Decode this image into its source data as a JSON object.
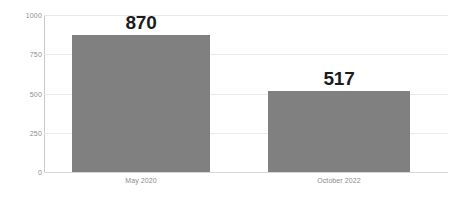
{
  "chart_data": {
    "type": "bar",
    "title": "",
    "subtitle": "",
    "xlabel": "",
    "ylabel": "",
    "categories": [
      "May 2020",
      "October 2022"
    ],
    "values": [
      870,
      517
    ],
    "data_labels": [
      "870",
      "517"
    ],
    "ylim": [
      0,
      1000
    ],
    "yticks": [
      1000,
      750,
      500,
      250,
      0
    ],
    "ytick_labels": [
      "1000",
      "750",
      "500",
      "250",
      "0"
    ],
    "grid": true,
    "legend": false,
    "legend_position": "none",
    "series": [
      {
        "name": "",
        "values": [
          870,
          517
        ]
      }
    ],
    "colors": {
      "bar_fill": "#808080",
      "gridline": "#e9e9e9",
      "axis_line": "#c9c9c9",
      "baseline": "#d8d8d8",
      "tick_label": "#8d8d8d",
      "category_label": "#8a8a8a",
      "data_label": "#1c1c1c",
      "background": "#ffffff"
    }
  }
}
